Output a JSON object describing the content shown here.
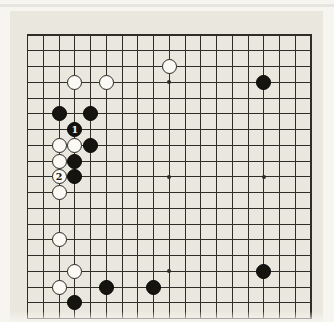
{
  "diagram": {
    "kind": "go-board-position",
    "board_size": 19,
    "colors": {
      "paper": "#eae7de",
      "page": "#f6f5f0",
      "grid_line": "#2f2d28",
      "black_stone": "#16140f",
      "white_stone": "#faf9f4"
    },
    "star_points": [
      [
        3,
        3
      ],
      [
        9,
        3
      ],
      [
        15,
        3
      ],
      [
        3,
        9
      ],
      [
        9,
        9
      ],
      [
        15,
        9
      ],
      [
        3,
        15
      ],
      [
        9,
        15
      ],
      [
        15,
        15
      ]
    ],
    "stones": [
      {
        "col": 9,
        "row": 2,
        "color": "white",
        "label": ""
      },
      {
        "col": 3,
        "row": 3,
        "color": "white",
        "label": ""
      },
      {
        "col": 5,
        "row": 3,
        "color": "white",
        "label": ""
      },
      {
        "col": 15,
        "row": 3,
        "color": "black",
        "label": ""
      },
      {
        "col": 2,
        "row": 5,
        "color": "black",
        "label": ""
      },
      {
        "col": 4,
        "row": 5,
        "color": "black",
        "label": ""
      },
      {
        "col": 3,
        "row": 6,
        "color": "black",
        "label": "1"
      },
      {
        "col": 2,
        "row": 7,
        "color": "white",
        "label": ""
      },
      {
        "col": 3,
        "row": 7,
        "color": "white",
        "label": ""
      },
      {
        "col": 4,
        "row": 7,
        "color": "black",
        "label": ""
      },
      {
        "col": 2,
        "row": 8,
        "color": "white",
        "label": ""
      },
      {
        "col": 3,
        "row": 8,
        "color": "black",
        "label": ""
      },
      {
        "col": 2,
        "row": 9,
        "color": "white",
        "label": "2"
      },
      {
        "col": 3,
        "row": 9,
        "color": "black",
        "label": ""
      },
      {
        "col": 2,
        "row": 10,
        "color": "white",
        "label": ""
      },
      {
        "col": 2,
        "row": 13,
        "color": "white",
        "label": ""
      },
      {
        "col": 3,
        "row": 15,
        "color": "white",
        "label": ""
      },
      {
        "col": 15,
        "row": 15,
        "color": "black",
        "label": ""
      },
      {
        "col": 2,
        "row": 16,
        "color": "white",
        "label": ""
      },
      {
        "col": 5,
        "row": 16,
        "color": "black",
        "label": ""
      },
      {
        "col": 8,
        "row": 16,
        "color": "black",
        "label": ""
      },
      {
        "col": 3,
        "row": 17,
        "color": "black",
        "label": ""
      }
    ]
  }
}
